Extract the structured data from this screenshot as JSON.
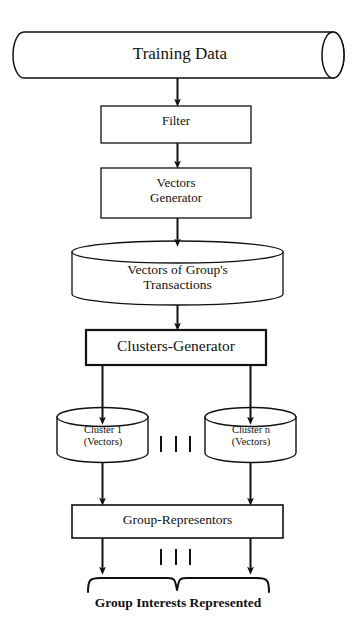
{
  "diagram": {
    "stroke_color": "#111111",
    "fill_color": "#ffffff",
    "nodes": {
      "training_data": {
        "label": "Training Data",
        "shape": "horizontal-cylinder"
      },
      "filter": {
        "label": "Filter",
        "shape": "rectangle"
      },
      "vectors_generator": {
        "label": "Vectors\nGenerator",
        "shape": "rectangle"
      },
      "vectors_of_groups_transactions": {
        "label": "Vectors of Group's\nTransactions",
        "shape": "database-cylinder"
      },
      "clusters_generator": {
        "label": "Clusters-Generator",
        "shape": "rectangle-bold"
      },
      "cluster_1": {
        "label": "Cluster 1\n(Vectors)",
        "shape": "database-cylinder"
      },
      "cluster_n": {
        "label": "Cluster n\n(Vectors)",
        "shape": "database-cylinder"
      },
      "group_representors": {
        "label": "Group-Representors",
        "shape": "rectangle"
      },
      "output_label": {
        "label": "Group Interests Represented",
        "shape": "text"
      }
    },
    "ellipsis": {
      "label": "| | |",
      "count": 3
    },
    "connectors": [
      {
        "from": "training_data",
        "to": "filter",
        "type": "arrow-down"
      },
      {
        "from": "filter",
        "to": "vectors_generator",
        "type": "arrow-down"
      },
      {
        "from": "vectors_generator",
        "to": "vectors_of_groups_transactions",
        "type": "arrow-down"
      },
      {
        "from": "vectors_of_groups_transactions",
        "to": "clusters_generator",
        "type": "arrow-down"
      },
      {
        "from": "clusters_generator",
        "to": "cluster_1",
        "type": "arrow-down"
      },
      {
        "from": "clusters_generator",
        "to": "cluster_n",
        "type": "arrow-down"
      },
      {
        "from": "cluster_1",
        "to": "group_representors",
        "type": "arrow-down"
      },
      {
        "from": "cluster_n",
        "to": "group_representors",
        "type": "arrow-down"
      },
      {
        "from": "group_representors",
        "to": "output_label",
        "type": "arrow-down-brace"
      }
    ]
  }
}
